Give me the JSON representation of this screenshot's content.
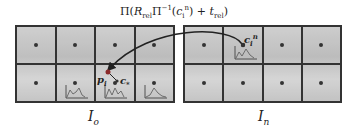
{
  "formula": {
    "pi": "Π(",
    "R": "R",
    "R_sub": "rel",
    "pi_inv": "Π",
    "pi_inv_sup": "−1",
    "open": "(",
    "c": "c",
    "c_sub": "i",
    "c_sup": "n",
    "close": ") + ",
    "t": "t",
    "t_sub": "rel",
    "end": ")"
  },
  "panels": {
    "left": {
      "label": "I",
      "label_sub": "o",
      "rows": 2,
      "cols": 4
    },
    "right": {
      "label": "I",
      "label_sub": "n",
      "rows": 2,
      "cols": 4
    }
  },
  "annotations": {
    "p_label": "p",
    "p_sub": "i",
    "c_star_label": "c",
    "c_star_sub": "*",
    "cin_label": "c",
    "cin_sub": "i",
    "cin_sup": "n"
  },
  "colors": {
    "grid_line": "#333333",
    "arrow": "#222222",
    "dot": "#333333",
    "highlight_dot": "#8a2a2a"
  }
}
